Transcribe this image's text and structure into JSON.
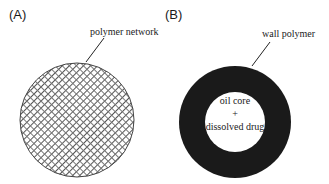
{
  "panels": [
    {
      "label": "(A)",
      "callout": "polymer network",
      "fill_style": "crosshatch"
    },
    {
      "label": "(B)",
      "callout": "wall polymer",
      "core_lines": [
        "oil core",
        "+",
        "dissolved drug"
      ],
      "wall_color": "#1a1a1a"
    }
  ]
}
